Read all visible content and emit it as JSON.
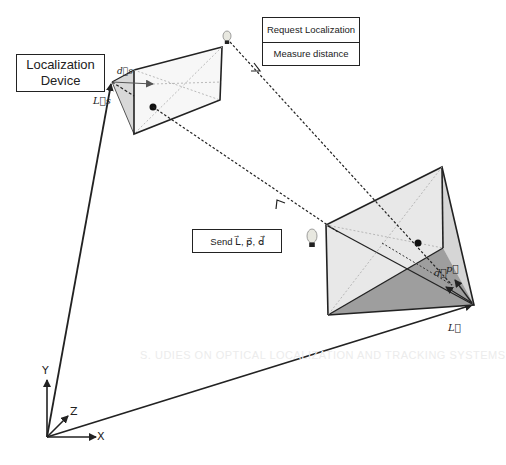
{
  "diagram": {
    "device_box": {
      "line1": "Localization",
      "line2": "Device"
    },
    "message_stack": [
      {
        "label": "Request Localization"
      },
      {
        "label": "Measure distance"
      }
    ],
    "send_box": {
      "label": "Send L⃗, p⃗, d⃗"
    },
    "vector_labels": {
      "small_L": "L⃗s",
      "small_d": "d⃗s",
      "large_L": "L⃗",
      "large_p": "p⃗",
      "large_d": "d⃗"
    },
    "axes": {
      "x": "X",
      "y": "Y",
      "z": "Z"
    },
    "icons": [
      "lightbulb-icon",
      "lightbulb-icon"
    ],
    "colors": {
      "line": "#222222",
      "face_light": "#e4e4e4",
      "face_mid": "#c8c8c8",
      "face_dark": "#9a9a9a"
    }
  },
  "background_bleed": {
    "heading": "S. UDIES ON OPTICAL LOCALIZATION AND TRACKING SYSTEMS"
  }
}
